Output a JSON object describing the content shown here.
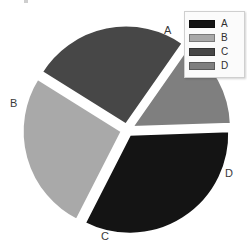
{
  "chart_data": {
    "type": "pie",
    "title": "",
    "categories": [
      "A",
      "B",
      "C",
      "D"
    ],
    "values": [
      33,
      26,
      26,
      15
    ],
    "units": "percent",
    "start_angle_deg": -2,
    "direction": "clockwise",
    "exploded": true,
    "explode_offset_px": 5,
    "slice_angles_deg": [
      {
        "name": "A",
        "start": -2,
        "end": 117
      },
      {
        "name": "B",
        "start": 117,
        "end": 212
      },
      {
        "name": "C",
        "start": 212,
        "end": 305
      },
      {
        "name": "D",
        "start": 305,
        "end": 358
      }
    ],
    "colors": {
      "A": "#141414",
      "B": "#a9a9a9",
      "C": "#474747",
      "D": "#7f7f7f"
    },
    "outer_labels": [
      {
        "name": "A",
        "text": "A"
      },
      {
        "name": "B",
        "text": "B"
      },
      {
        "name": "C",
        "text": "C"
      },
      {
        "name": "D",
        "text": "D"
      }
    ],
    "legend": {
      "position": "top-right",
      "entries": [
        {
          "label": "A",
          "color": "#141414"
        },
        {
          "label": "B",
          "color": "#a9a9a9"
        },
        {
          "label": "C",
          "color": "#474747"
        },
        {
          "label": "D",
          "color": "#7f7f7f"
        }
      ]
    },
    "background_color": "#ffffff",
    "gap_color": "#ffffff",
    "center_px": [
      127,
      130
    ],
    "radius_px": 100,
    "grid": false,
    "xlabel": "",
    "ylabel": ""
  }
}
